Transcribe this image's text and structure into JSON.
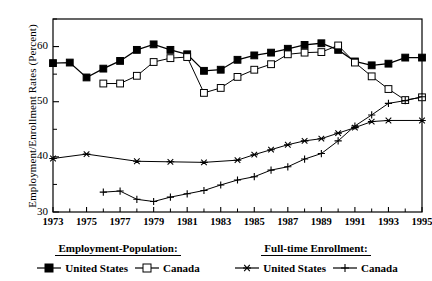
{
  "chart_data": {
    "type": "line",
    "title": "",
    "xlabel": "",
    "ylabel": "Employment/Enrollment Rates (Percent)",
    "xlim": [
      1973,
      1995
    ],
    "ylim": [
      30,
      65
    ],
    "grid": false,
    "legend_position": "below-axes",
    "y_ticks_major": [
      30,
      40,
      50,
      60
    ],
    "y_ticks_minor": [
      35,
      45,
      55,
      65
    ],
    "x_ticks_major": [
      1973,
      1975,
      1977,
      1979,
      1981,
      1983,
      1985,
      1987,
      1989,
      1991,
      1993,
      1995
    ],
    "x_ticks_minor": [
      1974,
      1976,
      1978,
      1980,
      1982,
      1984,
      1986,
      1988,
      1990,
      1992,
      1994
    ],
    "series": [
      {
        "name": "United States",
        "group": "Employment-Population",
        "marker": "filled-square",
        "x": [
          1973,
          1974,
          1975,
          1976,
          1977,
          1978,
          1979,
          1980,
          1981,
          1982,
          1983,
          1984,
          1985,
          1986,
          1987,
          1988,
          1989,
          1990,
          1991,
          1992,
          1993,
          1994,
          1995
        ],
        "values": [
          57.0,
          57.1,
          54.4,
          56.0,
          57.4,
          59.4,
          60.4,
          59.4,
          58.6,
          55.6,
          55.8,
          57.6,
          58.4,
          58.9,
          59.6,
          60.3,
          60.6,
          59.4,
          57.3,
          56.6,
          56.9,
          58.0,
          58.0
        ]
      },
      {
        "name": "Canada",
        "group": "Employment-Population",
        "marker": "open-square",
        "x": [
          1976,
          1977,
          1978,
          1979,
          1980,
          1981,
          1982,
          1983,
          1984,
          1985,
          1986,
          1987,
          1988,
          1989,
          1990,
          1991,
          1992,
          1993,
          1994,
          1995
        ],
        "values": [
          53.3,
          53.3,
          54.7,
          57.2,
          57.9,
          58.1,
          51.6,
          52.5,
          54.5,
          55.8,
          56.8,
          58.6,
          58.9,
          59.0,
          60.2,
          57.1,
          54.6,
          52.3,
          50.3,
          50.8
        ]
      },
      {
        "name": "United States",
        "group": "Full-time Enrollment",
        "marker": "asterisk",
        "x": [
          1973,
          1975,
          1978,
          1980,
          1982,
          1984,
          1985,
          1986,
          1987,
          1988,
          1989,
          1990,
          1991,
          1992,
          1993,
          1995
        ],
        "values": [
          39.7,
          40.5,
          39.2,
          39.1,
          39.0,
          39.4,
          40.4,
          41.3,
          42.2,
          42.9,
          43.3,
          44.3,
          45.3,
          46.4,
          46.6,
          46.6
        ]
      },
      {
        "name": "Canada",
        "group": "Full-time Enrollment",
        "marker": "plus",
        "x": [
          1976,
          1977,
          1978,
          1979,
          1980,
          1981,
          1982,
          1983,
          1984,
          1985,
          1986,
          1987,
          1988,
          1989,
          1990,
          1991,
          1992,
          1993,
          1994,
          1995
        ],
        "values": [
          33.6,
          33.8,
          32.3,
          31.9,
          32.7,
          33.3,
          33.9,
          34.9,
          35.8,
          36.4,
          37.6,
          38.2,
          39.6,
          40.6,
          42.9,
          45.6,
          47.6,
          49.7,
          50.2,
          50.9
        ]
      }
    ]
  },
  "axis": {
    "y_title": "Employment/Enrollment Rates (Percent)",
    "y_labels": [
      "60",
      "50",
      "40",
      "30"
    ],
    "x_labels": [
      "1973",
      "1975",
      "1977",
      "1979",
      "1981",
      "1983",
      "1985",
      "1987",
      "1989",
      "1991",
      "1993",
      "1995"
    ]
  },
  "legend": {
    "groups": [
      {
        "title": "Employment-Population:",
        "entries": [
          {
            "label": "United States",
            "marker": "filled-square"
          },
          {
            "label": "Canada",
            "marker": "open-square"
          }
        ]
      },
      {
        "title": "Full-time Enrollment:",
        "entries": [
          {
            "label": "United States",
            "marker": "asterisk"
          },
          {
            "label": "Canada",
            "marker": "plus"
          }
        ]
      }
    ]
  },
  "colors": {
    "line": "#000000",
    "fill": "#000000",
    "background": "#ffffff"
  }
}
